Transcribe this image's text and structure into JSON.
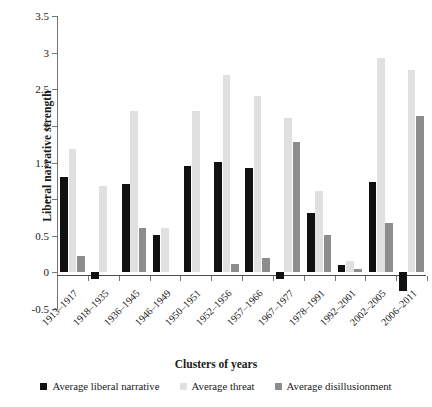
{
  "chart_data": {
    "type": "bar",
    "title": "",
    "xlabel": "Clusters of years",
    "ylabel": "Liberal narrative strength",
    "ylim": [
      -0.5,
      3.5
    ],
    "yticks": [
      -0.5,
      0,
      0.5,
      1,
      1.5,
      2,
      2.5,
      3,
      3.5
    ],
    "ytick_labels": [
      "-0.5",
      "0",
      "0.5",
      "1",
      "1.5",
      "2",
      "2.5",
      "3",
      "3.5"
    ],
    "grid": false,
    "legend_position": "bottom",
    "categories": [
      "1913–1917",
      "1918–1935",
      "1936–1945",
      "1946–1949",
      "1950–1951",
      "1952–1956",
      "1957–1966",
      "1967–1977",
      "1978–1991",
      "1992–2001",
      "2002–2005",
      "2006–2011"
    ],
    "series": [
      {
        "name": "Average liberal narrative",
        "color": "#111111",
        "values": [
          1.3,
          -0.09,
          1.21,
          0.51,
          1.45,
          1.51,
          1.43,
          -0.09,
          0.81,
          0.1,
          1.24,
          -0.26
        ]
      },
      {
        "name": "Average threat",
        "color": "#e0e0de",
        "values": [
          1.68,
          1.18,
          2.2,
          0.6,
          2.2,
          2.7,
          2.41,
          2.11,
          1.11,
          0.15,
          2.93,
          2.76
        ]
      },
      {
        "name": "Average disillusionment",
        "color": "#8d8d8d",
        "values": [
          0.23,
          0.0,
          0.61,
          0.0,
          0.0,
          0.11,
          0.19,
          1.78,
          0.51,
          0.04,
          0.68,
          2.13
        ]
      }
    ]
  },
  "legend": {
    "items": [
      {
        "label": "Average liberal narrative",
        "color": "#111111"
      },
      {
        "label": "Average threat",
        "color": "#e0e0de"
      },
      {
        "label": "Average disillusionment",
        "color": "#8d8d8d"
      }
    ]
  }
}
